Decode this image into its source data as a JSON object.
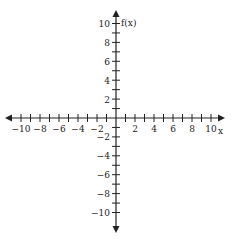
{
  "diagram": {
    "type": "coordinate-plane",
    "x_axis": {
      "label": "x",
      "min": -10,
      "max": 10,
      "tick_step": 1,
      "labeled_ticks": [
        "-10",
        "-8",
        "-6",
        "-4",
        "-2",
        "2",
        "4",
        "6",
        "8",
        "10"
      ]
    },
    "y_axis": {
      "label": "f(x)",
      "min": -10,
      "max": 10,
      "tick_step": 1,
      "labeled_ticks": [
        "10",
        "8",
        "6",
        "4",
        "2",
        "-2",
        "-4",
        "-6",
        "-8",
        "-10"
      ]
    },
    "colors": {
      "axis": "#222222",
      "background": "#ffffff"
    }
  }
}
